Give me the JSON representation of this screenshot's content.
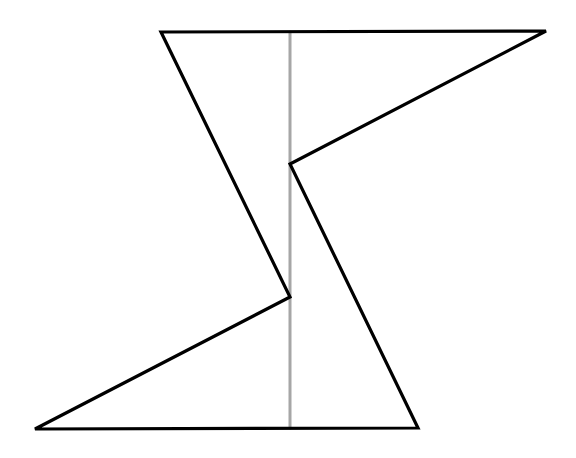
{
  "figure": {
    "type": "line-drawing",
    "colors": {
      "background": "#ffffff",
      "outline": "#000000",
      "axis_line": "#a6a6a6"
    },
    "polygon_points": "161,32 546,31 290,164 418,428 35,429 290,297",
    "axis_line": {
      "x1": 290,
      "y1": 32,
      "x2": 290,
      "y2": 428
    }
  }
}
